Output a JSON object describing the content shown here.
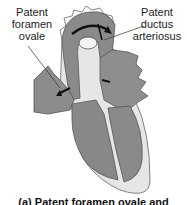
{
  "labels": {
    "patent_foramen_ovale": "Patent\nforamen\novale",
    "patent_ductus_arteriosus": "Patent\nductus\narteriosus"
  },
  "caption": "(a) Patent foramen ovale and",
  "colors": {
    "tissue_dark": "#7a7a7a",
    "tissue_mid": "#9a9a9a",
    "tissue_light": "#c8c8c8",
    "wall": "#e6e6e6",
    "outline": "#555555",
    "arrow": "#111111"
  }
}
